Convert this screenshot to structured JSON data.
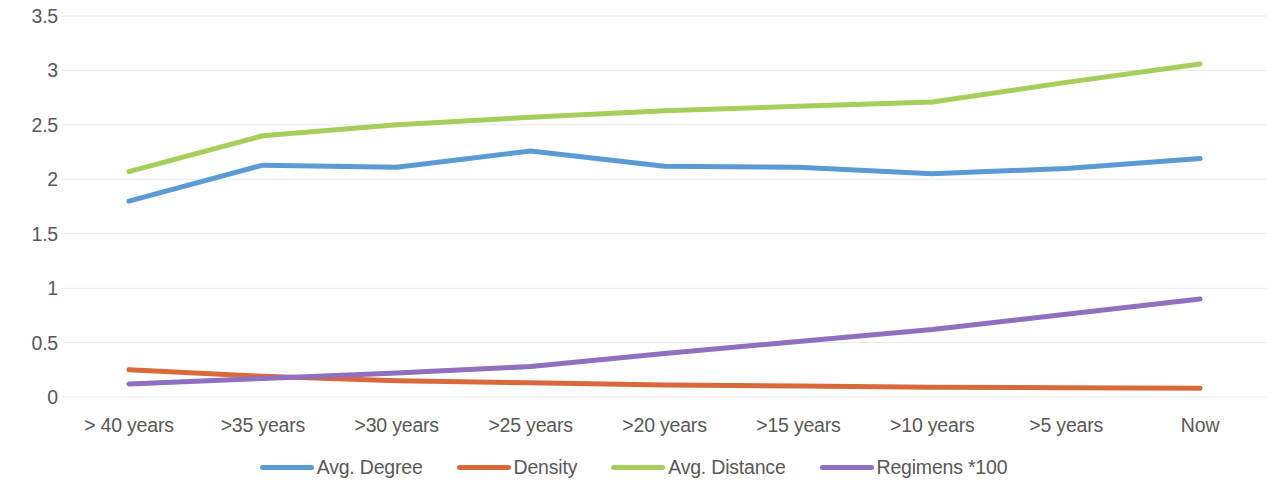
{
  "chart_data": {
    "type": "line",
    "title": "",
    "subtitle": "",
    "xlabel": "",
    "ylabel": "",
    "categories": [
      "> 40 years",
      ">35 years",
      ">30 years",
      ">25 years",
      ">20 years",
      ">15 years",
      ">10 years",
      ">5 years",
      "Now"
    ],
    "ylim": [
      0,
      3.5
    ],
    "yticks": [
      "0",
      "0.5",
      "1",
      "1.5",
      "2",
      "2.5",
      "3",
      "3.5"
    ],
    "ytick_values": [
      0,
      0.5,
      1,
      1.5,
      2,
      2.5,
      3,
      3.5
    ],
    "grid": true,
    "grid_axis": "y",
    "legend_position": "bottom",
    "series": [
      {
        "name": "Avg. Degree",
        "color": "#5B9BD5",
        "values": [
          1.8,
          2.13,
          2.11,
          2.26,
          2.12,
          2.11,
          2.05,
          2.1,
          2.19
        ]
      },
      {
        "name": "Density",
        "color": "#D9693B",
        "values": [
          0.25,
          0.19,
          0.15,
          0.13,
          0.11,
          0.1,
          0.09,
          0.085,
          0.08
        ]
      },
      {
        "name": "Avg. Distance",
        "color": "#A5CE5B",
        "values": [
          2.07,
          2.4,
          2.5,
          2.57,
          2.63,
          2.67,
          2.71,
          2.89,
          3.06
        ]
      },
      {
        "name": "Regimens *100",
        "color": "#8E6FC0",
        "values": [
          0.12,
          0.17,
          0.22,
          0.28,
          0.4,
          0.51,
          0.62,
          0.76,
          0.9
        ]
      }
    ]
  },
  "style": {
    "background": "#ffffff",
    "text_color": "#595959",
    "gridline_color": "#e8e8e8",
    "line_width": 5
  }
}
